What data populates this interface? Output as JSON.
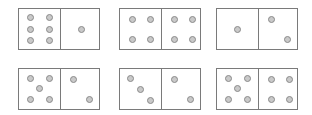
{
  "colors": {
    "border": "#7a7a7a",
    "pip_fill": "#c9c9c9",
    "pip_stroke": "#8a8a8a",
    "background": "#ffffff"
  },
  "dominoes": [
    {
      "left": 6,
      "right": 1,
      "x": 18,
      "y": 8
    },
    {
      "left": 4,
      "right": 4,
      "x": 119,
      "y": 8
    },
    {
      "left": 1,
      "right": 2,
      "x": 216,
      "y": 8
    },
    {
      "left": 5,
      "right": 2,
      "x": 18,
      "y": 68
    },
    {
      "left": 3,
      "right": 2,
      "x": 119,
      "y": 68
    },
    {
      "left": 5,
      "right": 4,
      "x": 216,
      "y": 68
    }
  ]
}
